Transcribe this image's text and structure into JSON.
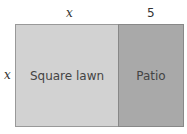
{
  "diagram": {
    "top_labels": {
      "lawn_width": "x",
      "patio_width": "5"
    },
    "side_label": "x",
    "regions": [
      {
        "label": "Square lawn",
        "color": "#d2d2d2"
      },
      {
        "label": "Patio",
        "color": "#a9a9a9"
      }
    ]
  }
}
